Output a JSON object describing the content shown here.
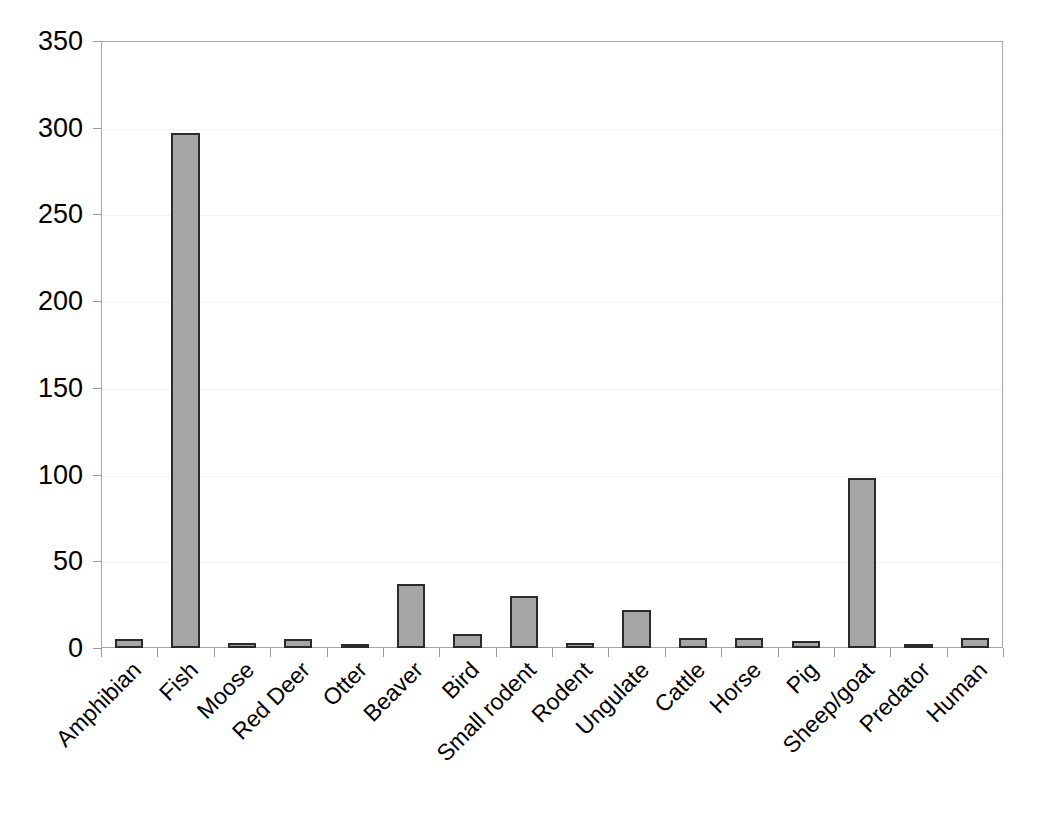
{
  "chart_data": {
    "type": "bar",
    "title": "",
    "xlabel": "",
    "ylabel": "",
    "ylim": [
      0,
      350
    ],
    "ytick_step": 50,
    "yticks": [
      0,
      50,
      100,
      150,
      200,
      250,
      300,
      350
    ],
    "grid": true,
    "legend": null,
    "bar_fill_color": "#a6a6a6",
    "bar_border_color": "#2b2b2b",
    "axis_color": "#a7a7a7",
    "categories": [
      "Amphibian",
      "Fish",
      "Moose",
      "Red Deer",
      "Otter",
      "Beaver",
      "Bird",
      "Small rodent",
      "Rodent",
      "Ungulate",
      "Cattle",
      "Horse",
      "Pig",
      "Sheep/goat",
      "Predator",
      "Human"
    ],
    "values": [
      5,
      297,
      3,
      5,
      2,
      37,
      8,
      30,
      3,
      22,
      6,
      6,
      4,
      98,
      2,
      6
    ]
  }
}
